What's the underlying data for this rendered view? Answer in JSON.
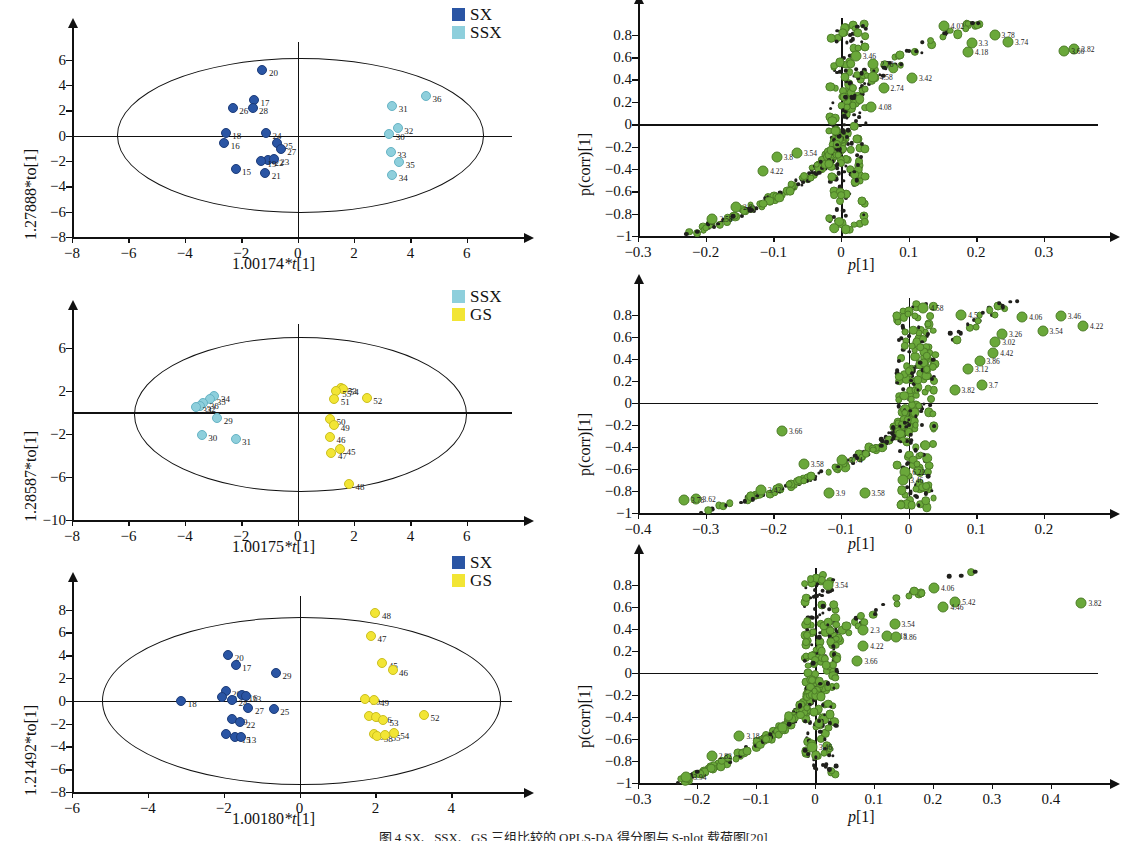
{
  "figure": {
    "caption": "图 4 SX、SSX、GS 三组比较的 OPLS-DA 得分图与 S-plot 载荷图[20]",
    "groups": [
      {
        "key": "SX",
        "label": "SX",
        "color": "#2a55a4"
      },
      {
        "key": "SSX",
        "label": "SSX",
        "color": "#8ecfdc"
      },
      {
        "key": "GS",
        "label": "GS",
        "color": "#f2e534"
      }
    ],
    "marker_color_splot": "#6aa83a"
  },
  "chart_data": [
    {
      "id": "score-plot-1",
      "type": "scatter",
      "title": "",
      "xlabel": "1.00174*t[1]",
      "ylabel": "1.27888*to[1]",
      "xlim": [
        -8,
        7.6
      ],
      "ylim": [
        -8,
        7.4
      ],
      "xticks": [
        -8,
        -6,
        -4,
        -2,
        0,
        2,
        4,
        6
      ],
      "yticks": [
        6,
        4,
        2,
        0,
        -2,
        -4,
        -6,
        -8
      ],
      "grid": false,
      "legend_position": "top-right",
      "legend": [
        "SX",
        "SSX"
      ],
      "ellipse": {
        "cx": 0.1,
        "cy": 0.0,
        "rx": 6.5,
        "ry": 6.1
      },
      "series": [
        {
          "name": "SX",
          "color": "#2a55a4",
          "points": [
            {
              "label": "20",
              "x": -1.25,
              "y": 5.15
            },
            {
              "label": "17",
              "x": -1.55,
              "y": 2.85
            },
            {
              "label": "28",
              "x": -1.6,
              "y": 2.15
            },
            {
              "label": "26",
              "x": -2.3,
              "y": 2.2
            },
            {
              "label": "18",
              "x": -2.55,
              "y": 0.25
            },
            {
              "label": "16",
              "x": -2.6,
              "y": -0.6
            },
            {
              "label": "24",
              "x": -1.12,
              "y": 0.2
            },
            {
              "label": "25",
              "x": -0.72,
              "y": -0.55
            },
            {
              "label": "27",
              "x": -0.6,
              "y": -1.05
            },
            {
              "label": "22",
              "x": -1.05,
              "y": -1.9
            },
            {
              "label": "23",
              "x": -0.85,
              "y": -1.85
            },
            {
              "label": "15",
              "x": -2.2,
              "y": -2.6
            },
            {
              "label": "21",
              "x": -1.15,
              "y": -2.95
            },
            {
              "label": "19",
              "x": -1.3,
              "y": -2.0
            }
          ]
        },
        {
          "name": "SSX",
          "color": "#8ecfdc",
          "points": [
            {
              "label": "36",
              "x": 4.55,
              "y": 3.15
            },
            {
              "label": "31",
              "x": 3.35,
              "y": 2.35
            },
            {
              "label": "32",
              "x": 3.55,
              "y": 0.6
            },
            {
              "label": "30",
              "x": 3.25,
              "y": 0.15
            },
            {
              "label": "33",
              "x": 3.3,
              "y": -1.25
            },
            {
              "label": "35",
              "x": 3.6,
              "y": -2.1
            },
            {
              "label": "34",
              "x": 3.35,
              "y": -3.1
            }
          ]
        }
      ]
    },
    {
      "id": "s-plot-1",
      "type": "scatter",
      "title": "",
      "xlabel": "p[1]",
      "ylabel": "p(corr)[1]",
      "xlim": [
        -0.3,
        0.38
      ],
      "ylim": [
        -1,
        0.95
      ],
      "xticks": [
        -0.3,
        -0.2,
        -0.1,
        0,
        0.1,
        0.2,
        0.3
      ],
      "yticks": [
        0.8,
        0.6,
        0.4,
        0.2,
        0,
        -0.2,
        -0.4,
        -0.6,
        -0.8,
        -1
      ],
      "grid": false,
      "annotations": [
        {
          "label": "4.02",
          "x": 0.152,
          "y": 0.875
        },
        {
          "label": "3.3",
          "x": 0.193,
          "y": 0.725
        },
        {
          "label": "4.18",
          "x": 0.188,
          "y": 0.645
        },
        {
          "label": "3.78",
          "x": 0.227,
          "y": 0.795
        },
        {
          "label": "3.74",
          "x": 0.247,
          "y": 0.735
        },
        {
          "label": "3.82",
          "x": 0.345,
          "y": 0.675
        },
        {
          "label": "3.66",
          "x": 0.33,
          "y": 0.655
        },
        {
          "label": "3.46",
          "x": 0.022,
          "y": 0.61
        },
        {
          "label": "2.78",
          "x": 0.048,
          "y": 0.535
        },
        {
          "label": "4.58",
          "x": 0.047,
          "y": 0.425
        },
        {
          "label": "3.42",
          "x": 0.105,
          "y": 0.415
        },
        {
          "label": "2.74",
          "x": 0.063,
          "y": 0.325
        },
        {
          "label": "4.08",
          "x": 0.045,
          "y": 0.155
        },
        {
          "label": "3.54",
          "x": -0.065,
          "y": -0.255
        },
        {
          "label": "3.8",
          "x": -0.095,
          "y": -0.29
        },
        {
          "label": "4.22",
          "x": -0.115,
          "y": -0.42
        },
        {
          "label": "2.58",
          "x": -0.19,
          "y": -0.845
        },
        {
          "label": "2.8",
          "x": -0.155,
          "y": -0.745
        }
      ]
    },
    {
      "id": "score-plot-2",
      "type": "scatter",
      "title": "",
      "xlabel": "1.00175*t[1]",
      "ylabel": "1.28587*to[1]",
      "xlim": [
        -8,
        7.6
      ],
      "ylim": [
        -10,
        8.2
      ],
      "xticks": [
        -8,
        -6,
        -4,
        -2,
        0,
        2,
        4,
        6
      ],
      "yticks": [
        6,
        2,
        -2,
        -6,
        -10
      ],
      "grid": false,
      "legend_position": "top-right",
      "legend": [
        "SSX",
        "GS"
      ],
      "ellipse": {
        "cx": 0.1,
        "cy": -0.2,
        "rx": 5.9,
        "ry": 7.2
      },
      "series": [
        {
          "name": "SSX",
          "color": "#8ecfdc",
          "points": [
            {
              "label": "34",
              "x": -2.95,
              "y": 1.55
            },
            {
              "label": "35",
              "x": -3.1,
              "y": 1.2
            },
            {
              "label": "36",
              "x": -3.35,
              "y": 0.9
            },
            {
              "label": "32",
              "x": -3.45,
              "y": 0.6
            },
            {
              "label": "33",
              "x": -3.6,
              "y": 0.45
            },
            {
              "label": "29",
              "x": -2.85,
              "y": -0.55
            },
            {
              "label": "30",
              "x": -3.4,
              "y": -2.1
            },
            {
              "label": "31",
              "x": -2.2,
              "y": -2.45
            }
          ]
        },
        {
          "name": "GS",
          "color": "#f2e534",
          "points": [
            {
              "label": "53",
              "x": 1.55,
              "y": 2.3
            },
            {
              "label": "54",
              "x": 1.62,
              "y": 2.15
            },
            {
              "label": "55",
              "x": 1.35,
              "y": 1.95
            },
            {
              "label": "51",
              "x": 1.3,
              "y": 1.25
            },
            {
              "label": "52",
              "x": 2.45,
              "y": 1.35
            },
            {
              "label": "50",
              "x": 1.15,
              "y": -0.65
            },
            {
              "label": "49",
              "x": 1.3,
              "y": -1.15
            },
            {
              "label": "46",
              "x": 1.15,
              "y": -2.25
            },
            {
              "label": "45",
              "x": 1.5,
              "y": -3.45
            },
            {
              "label": "47",
              "x": 1.2,
              "y": -3.8
            },
            {
              "label": "48",
              "x": 1.82,
              "y": -6.7
            }
          ]
        }
      ]
    },
    {
      "id": "s-plot-2",
      "type": "scatter",
      "title": "",
      "xlabel": "p[1]",
      "ylabel": "p(corr)[1]",
      "xlim": [
        -0.4,
        0.28
      ],
      "ylim": [
        -1,
        0.95
      ],
      "xticks": [
        -0.4,
        -0.3,
        -0.2,
        -0.1,
        0,
        0.1,
        0.2
      ],
      "yticks": [
        0.8,
        0.6,
        0.4,
        0.2,
        0,
        -0.2,
        -0.4,
        -0.6,
        -0.8,
        -1
      ],
      "grid": false,
      "annotations": [
        {
          "label": "4.58",
          "x": 0.022,
          "y": 0.855
        },
        {
          "label": "4.5",
          "x": 0.078,
          "y": 0.8
        },
        {
          "label": "4.06",
          "x": 0.168,
          "y": 0.775
        },
        {
          "label": "3.46",
          "x": 0.225,
          "y": 0.79
        },
        {
          "label": "4.22",
          "x": 0.258,
          "y": 0.7
        },
        {
          "label": "3.54",
          "x": 0.198,
          "y": 0.655
        },
        {
          "label": "3.26",
          "x": 0.138,
          "y": 0.625
        },
        {
          "label": "3.02",
          "x": 0.128,
          "y": 0.555
        },
        {
          "label": "4.42",
          "x": 0.125,
          "y": 0.455
        },
        {
          "label": "3.86",
          "x": 0.105,
          "y": 0.375
        },
        {
          "label": "3.12",
          "x": 0.088,
          "y": 0.31
        },
        {
          "label": "3.82",
          "x": 0.068,
          "y": 0.115
        },
        {
          "label": "3.7",
          "x": 0.108,
          "y": 0.165
        },
        {
          "label": "3.66",
          "x": -0.187,
          "y": -0.26
        },
        {
          "label": "3.58",
          "x": -0.155,
          "y": -0.555
        },
        {
          "label": "3.74",
          "x": -0.098,
          "y": -0.52
        },
        {
          "label": "6.22",
          "x": -0.005,
          "y": -0.625
        },
        {
          "label": "3.46",
          "x": -0.008,
          "y": -0.7
        },
        {
          "label": "3.42",
          "x": -0.218,
          "y": -0.795
        },
        {
          "label": "3.58",
          "x": -0.065,
          "y": -0.815
        },
        {
          "label": "3.9",
          "x": -0.118,
          "y": -0.82
        },
        {
          "label": "3.62",
          "x": -0.315,
          "y": -0.875
        },
        {
          "label": "3.78",
          "x": -0.332,
          "y": -0.885
        }
      ]
    },
    {
      "id": "score-plot-3",
      "type": "scatter",
      "title": "",
      "xlabel": "1.00180*t[1]",
      "ylabel": "1.21492*to[1]",
      "xlim": [
        -6,
        5.6
      ],
      "ylim": [
        -8,
        9.2
      ],
      "xticks": [
        -6,
        -4,
        -2,
        0,
        2,
        4
      ],
      "yticks": [
        8,
        6,
        4,
        2,
        0,
        -2,
        -4,
        -6,
        -8
      ],
      "grid": false,
      "legend_position": "top-right",
      "legend": [
        "SX",
        "GS"
      ],
      "ellipse": {
        "cx": 0.05,
        "cy": 0.0,
        "rx": 5.25,
        "ry": 7.35
      },
      "series": [
        {
          "name": "SX",
          "color": "#2a55a4",
          "points": [
            {
              "label": "20",
              "x": -1.88,
              "y": 4.05
            },
            {
              "label": "17",
              "x": -1.68,
              "y": 3.15
            },
            {
              "label": "29",
              "x": -0.62,
              "y": 2.45
            },
            {
              "label": "26",
              "x": -1.95,
              "y": 0.85
            },
            {
              "label": "28",
              "x": -2.05,
              "y": 0.35
            },
            {
              "label": "16",
              "x": -1.52,
              "y": 0.55
            },
            {
              "label": "23",
              "x": -1.42,
              "y": 0.45
            },
            {
              "label": "18",
              "x": -3.12,
              "y": 0.0
            },
            {
              "label": "24",
              "x": -1.78,
              "y": 0.1
            },
            {
              "label": "27",
              "x": -1.35,
              "y": -0.65
            },
            {
              "label": "25",
              "x": -0.68,
              "y": -0.75
            },
            {
              "label": "19",
              "x": -1.78,
              "y": -1.55
            },
            {
              "label": "22",
              "x": -1.58,
              "y": -1.85
            },
            {
              "label": "21",
              "x": -1.95,
              "y": -2.95
            },
            {
              "label": "15",
              "x": -1.7,
              "y": -3.15
            },
            {
              "label": "13",
              "x": -1.55,
              "y": -3.2
            }
          ]
        },
        {
          "name": "GS",
          "color": "#f2e534",
          "points": [
            {
              "label": "48",
              "x": 2.0,
              "y": 7.7
            },
            {
              "label": "47",
              "x": 1.88,
              "y": 5.65
            },
            {
              "label": "45",
              "x": 2.18,
              "y": 3.35
            },
            {
              "label": "46",
              "x": 2.45,
              "y": 2.75
            },
            {
              "label": "50",
              "x": 1.72,
              "y": 0.15
            },
            {
              "label": "49",
              "x": 1.95,
              "y": 0.1
            },
            {
              "label": "51",
              "x": 1.82,
              "y": -1.35
            },
            {
              "label": "56",
              "x": 2.02,
              "y": -1.45
            },
            {
              "label": "53",
              "x": 2.2,
              "y": -1.7
            },
            {
              "label": "52",
              "x": 3.28,
              "y": -1.2
            },
            {
              "label": "57",
              "x": 1.95,
              "y": -2.95
            },
            {
              "label": "58",
              "x": 2.05,
              "y": -3.05
            },
            {
              "label": "55",
              "x": 2.25,
              "y": -3.0
            },
            {
              "label": "54",
              "x": 2.48,
              "y": -2.8
            }
          ]
        }
      ]
    },
    {
      "id": "s-plot-3",
      "type": "scatter",
      "title": "",
      "xlabel": "p[1]",
      "ylabel": "p(corr)[1]",
      "xlim": [
        -0.3,
        0.48
      ],
      "ylim": [
        -1,
        0.95
      ],
      "xticks": [
        -0.3,
        -0.2,
        -0.1,
        0,
        0.1,
        0.2,
        0.3,
        0.4
      ],
      "yticks": [
        0.8,
        0.6,
        0.4,
        0.2,
        0,
        -0.2,
        -0.4,
        -0.6,
        -0.8,
        -1
      ],
      "grid": false,
      "annotations": [
        {
          "label": "3.54",
          "x": 0.022,
          "y": 0.8
        },
        {
          "label": "4.06",
          "x": 0.202,
          "y": 0.765
        },
        {
          "label": "5.42",
          "x": 0.238,
          "y": 0.645
        },
        {
          "label": "4.46",
          "x": 0.218,
          "y": 0.6
        },
        {
          "label": "3.82",
          "x": 0.452,
          "y": 0.635
        },
        {
          "label": "3.54",
          "x": 0.135,
          "y": 0.445
        },
        {
          "label": "2.3",
          "x": 0.082,
          "y": 0.385
        },
        {
          "label": "4.18",
          "x": 0.122,
          "y": 0.33
        },
        {
          "label": "3.86",
          "x": 0.138,
          "y": 0.325
        },
        {
          "label": "4.22",
          "x": 0.082,
          "y": 0.245
        },
        {
          "label": "3.66",
          "x": 0.072,
          "y": 0.105
        },
        {
          "label": "3.46",
          "x": -0.005,
          "y": -0.675
        },
        {
          "label": "3.94",
          "x": -0.218,
          "y": -0.945
        },
        {
          "label": "3.18",
          "x": -0.128,
          "y": -0.57
        },
        {
          "label": "2.82",
          "x": -0.175,
          "y": -0.755
        }
      ]
    }
  ]
}
